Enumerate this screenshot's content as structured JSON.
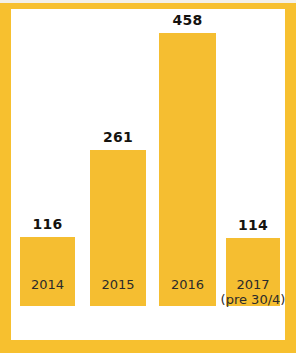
{
  "chart_data": {
    "type": "bar",
    "title": "",
    "subtitle": "",
    "xlabel": "",
    "ylabel": "",
    "categories": [
      "2014",
      "2015",
      "2016",
      "2017"
    ],
    "category_sublabels": [
      "",
      "",
      "",
      "(pre 30/4)"
    ],
    "values": [
      116,
      261,
      458,
      114
    ],
    "value_labels": [
      "116",
      "261",
      "458",
      "114"
    ],
    "ylim": [
      0,
      458
    ],
    "grid": false,
    "legend": null,
    "legend_position": "none",
    "axis_line": false,
    "tick_labels_x": [
      "2014",
      "2015",
      "2016",
      "2017"
    ],
    "tick_labels_y": [],
    "series": [
      {
        "name": "",
        "values": [
          116,
          261,
          458,
          114
        ]
      }
    ],
    "annotations": [
      {
        "target": "2017",
        "text": "(pre 30/4)"
      }
    ]
  },
  "style": {
    "bar_color": "#F5BE31",
    "frame_color": "#F7C02F",
    "plot_background": "#FFFFFF",
    "value_label_color": "#15130F",
    "tick_label_color": "#2B2B2B"
  }
}
